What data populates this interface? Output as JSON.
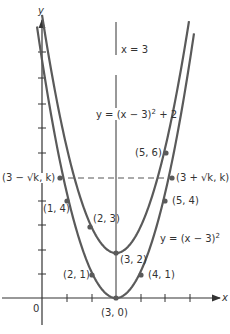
{
  "diagram": {
    "type": "function-graph",
    "axes": {
      "x_label": "x",
      "y_label": "y",
      "origin_label": "0"
    },
    "lines": {
      "symmetry_label": "x = 3"
    },
    "curves": [
      {
        "name": "outer",
        "equation_prefix": "y = (x − 3)",
        "exponent": "2",
        "equation_suffix": ""
      },
      {
        "name": "inner",
        "equation_prefix": "y = (x − 3)",
        "exponent": "2",
        "equation_suffix": " + 2"
      }
    ],
    "points": {
      "p30": "(3, 0)",
      "p32": "(3, 2)",
      "p21": "(2, 1)",
      "p41": "(4, 1)",
      "p14": "(1, 4)",
      "p54": "(5, 4)",
      "p23": "(2, 3)",
      "p56": "(5, 6)",
      "left_k": "(3 − √k, k)",
      "right_k": "(3 + √k, k)"
    },
    "colors": {
      "curve": "#5a5a5a",
      "axis": "#333333",
      "text": "#333333"
    }
  }
}
